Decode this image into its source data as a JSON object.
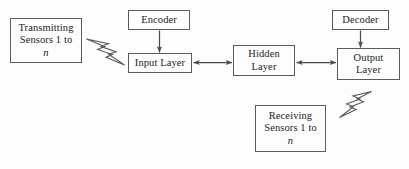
{
  "figure": {
    "type": "block-diagram",
    "background_color": "#fdfdfd",
    "stroke_color": "#5a5a5a",
    "text_color": "#1c1c1c"
  },
  "nodes": {
    "transmitting_sensors": {
      "line1": "Transmitting",
      "line2": "Sensors 1 to",
      "line3": "n"
    },
    "encoder": {
      "label": "Encoder"
    },
    "input_layer": {
      "label": "Input Layer"
    },
    "hidden_layer": {
      "line1": "Hidden",
      "line2": "Layer"
    },
    "decoder": {
      "label": "Decoder"
    },
    "output_layer": {
      "line1": "Output",
      "line2": "Layer"
    },
    "receiving_sensors": {
      "line1": "Receiving",
      "line2": "Sensors 1 to",
      "line3": "n"
    }
  },
  "connectors": [
    {
      "name": "encoder-to-input-layer",
      "from": "encoder",
      "to": "input_layer",
      "style": "single-arrow",
      "direction": "down"
    },
    {
      "name": "input-layer-to-hidden-layer",
      "from": "input_layer",
      "to": "hidden_layer",
      "style": "double-arrow",
      "direction": "horizontal"
    },
    {
      "name": "hidden-layer-to-output-layer",
      "from": "hidden_layer",
      "to": "output_layer",
      "style": "double-arrow",
      "direction": "horizontal"
    },
    {
      "name": "decoder-to-output-layer",
      "from": "decoder",
      "to": "output_layer",
      "style": "single-arrow",
      "direction": "down"
    }
  ],
  "wireless_links": [
    {
      "name": "transmit-wireless-link",
      "icon": "lightning-bolt-icon",
      "orientation": "down-right",
      "between": [
        "transmitting_sensors",
        "input_layer"
      ]
    },
    {
      "name": "receive-wireless-link",
      "icon": "lightning-bolt-icon",
      "orientation": "down-left",
      "between": [
        "output_layer",
        "receiving_sensors"
      ]
    }
  ]
}
